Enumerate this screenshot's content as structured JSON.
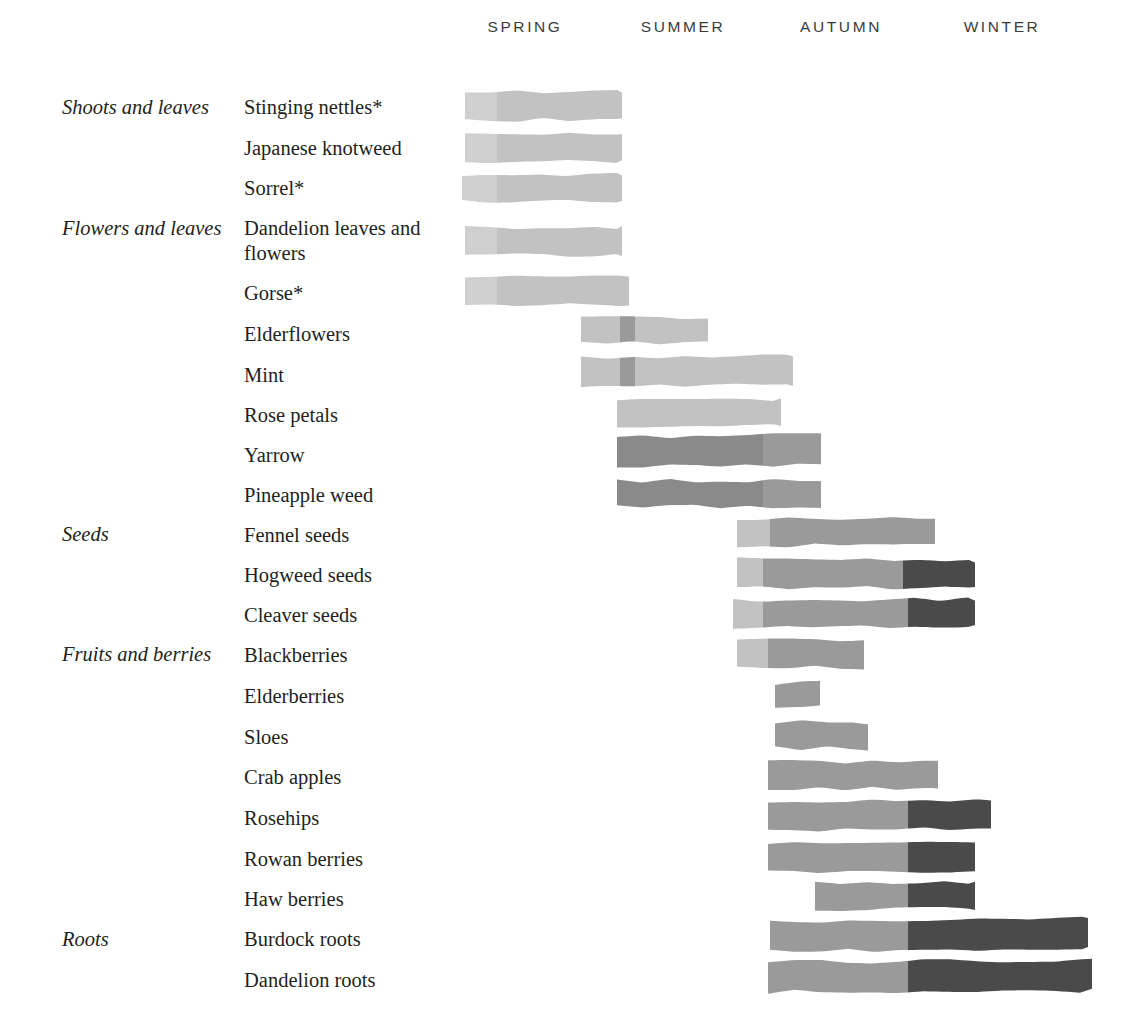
{
  "chart_data": {
    "type": "bar",
    "title": "",
    "subtitle": "",
    "xlabel": "",
    "ylabel": "",
    "grid": false,
    "legend_position": "none",
    "orientation": "horizontal",
    "axis": {
      "seasons": [
        "SPRING",
        "SUMMER",
        "AUTUMN",
        "WINTER"
      ],
      "season_centers_px": [
        525,
        683,
        841,
        1002
      ],
      "season_start_px": 465,
      "season_width_px": 158,
      "x_range_px": [
        465,
        1092
      ]
    },
    "shades": {
      "light": "#cfcfcf",
      "light2": "#c2c2c2",
      "medium": "#9a9a9a",
      "medium_dark": "#8a8a8a",
      "dark": "#4a4a4a"
    },
    "groups": [
      {
        "label": "Shoots and leaves",
        "top_px": 95,
        "row_span": 3
      },
      {
        "label": "Flowers and leaves",
        "top_px": 216,
        "row_span": 7
      },
      {
        "label": "Seeds",
        "top_px": 522,
        "row_span": 3
      },
      {
        "label": "Fruits and berries",
        "top_px": 642,
        "row_span": 7
      },
      {
        "label": "Roots",
        "top_px": 927,
        "row_span": 2
      }
    ],
    "categories": [
      "Stinging nettles*",
      "Japanese knotweed",
      "Sorrel*",
      "Dandelion leaves and flowers",
      "Gorse*",
      "Elderflowers",
      "Mint",
      "Rose petals",
      "Yarrow",
      "Pineapple weed",
      "Fennel seeds",
      "Hogweed seeds",
      "Cleaver seeds",
      "Blackberries",
      "Elderberries",
      "Sloes",
      "Crab apples",
      "Rosehips",
      "Rowan berries",
      "Haw berries",
      "Burdock roots",
      "Dandelion roots"
    ],
    "rows": [
      {
        "name": "Stinging nettles*",
        "label": "Stinging nettles*",
        "label_top": 95,
        "label_lines": 1,
        "bar_y": 92,
        "bar_h": 28,
        "start_px": 465,
        "end_px": 622,
        "seasons": [
          "spring"
        ],
        "segments": [
          {
            "from": 465,
            "to": 497,
            "shade": "light"
          },
          {
            "from": 497,
            "to": 622,
            "shade": "light2"
          }
        ]
      },
      {
        "name": "Japanese knotweed",
        "label": "Japanese knotweed",
        "label_top": 136,
        "label_lines": 1,
        "bar_y": 133,
        "bar_h": 28,
        "start_px": 465,
        "end_px": 622,
        "seasons": [
          "spring"
        ],
        "segments": [
          {
            "from": 465,
            "to": 497,
            "shade": "light"
          },
          {
            "from": 497,
            "to": 622,
            "shade": "light2"
          }
        ]
      },
      {
        "name": "Sorrel*",
        "label": "Sorrel*",
        "label_top": 176,
        "label_lines": 1,
        "bar_y": 175,
        "bar_h": 27,
        "start_px": 462,
        "end_px": 622,
        "seasons": [
          "spring"
        ],
        "segments": [
          {
            "from": 462,
            "to": 497,
            "shade": "light"
          },
          {
            "from": 497,
            "to": 622,
            "shade": "light2"
          }
        ]
      },
      {
        "name": "Dandelion leaves and flowers",
        "label": "Dandelion leaves and flowers",
        "label_top": 216,
        "label_lines": 2,
        "bar_y": 228,
        "bar_h": 27,
        "start_px": 465,
        "end_px": 622,
        "seasons": [
          "spring"
        ],
        "segments": [
          {
            "from": 465,
            "to": 497,
            "shade": "light"
          },
          {
            "from": 497,
            "to": 622,
            "shade": "light2"
          }
        ]
      },
      {
        "name": "Gorse*",
        "label": "Gorse*",
        "label_top": 281,
        "label_lines": 1,
        "bar_y": 278,
        "bar_h": 28,
        "start_px": 465,
        "end_px": 629,
        "seasons": [
          "spring"
        ],
        "segments": [
          {
            "from": 465,
            "to": 497,
            "shade": "light"
          },
          {
            "from": 497,
            "to": 629,
            "shade": "light2"
          }
        ]
      },
      {
        "name": "Elderflowers",
        "label": "Elderflowers",
        "label_top": 322,
        "label_lines": 1,
        "bar_y": 316,
        "bar_h": 26,
        "start_px": 581,
        "end_px": 708,
        "seasons": [
          "spring",
          "summer"
        ],
        "segments": [
          {
            "from": 581,
            "to": 620,
            "shade": "light2"
          },
          {
            "from": 620,
            "to": 635,
            "shade": "medium"
          },
          {
            "from": 635,
            "to": 708,
            "shade": "light2"
          }
        ]
      },
      {
        "name": "Mint",
        "label": "Mint",
        "label_top": 363,
        "label_lines": 1,
        "bar_y": 358,
        "bar_h": 28,
        "start_px": 581,
        "end_px": 793,
        "seasons": [
          "spring",
          "summer"
        ],
        "segments": [
          {
            "from": 581,
            "to": 620,
            "shade": "light2"
          },
          {
            "from": 620,
            "to": 635,
            "shade": "medium"
          },
          {
            "from": 635,
            "to": 793,
            "shade": "light2"
          }
        ]
      },
      {
        "name": "Rose petals",
        "label": "Rose petals",
        "label_top": 403,
        "label_lines": 1,
        "bar_y": 400,
        "bar_h": 26,
        "start_px": 617,
        "end_px": 781,
        "seasons": [
          "summer"
        ],
        "segments": [
          {
            "from": 617,
            "to": 781,
            "shade": "light2"
          }
        ]
      },
      {
        "name": "Yarrow",
        "label": "Yarrow",
        "label_top": 443,
        "label_lines": 1,
        "bar_y": 437,
        "bar_h": 30,
        "start_px": 617,
        "end_px": 821,
        "seasons": [
          "summer",
          "autumn"
        ],
        "segments": [
          {
            "from": 617,
            "to": 763,
            "shade": "medium_dark"
          },
          {
            "from": 763,
            "to": 821,
            "shade": "medium"
          }
        ]
      },
      {
        "name": "Pineapple weed",
        "label": "Pineapple weed",
        "label_top": 483,
        "label_lines": 1,
        "bar_y": 481,
        "bar_h": 26,
        "start_px": 617,
        "end_px": 821,
        "seasons": [
          "summer",
          "autumn"
        ],
        "segments": [
          {
            "from": 617,
            "to": 763,
            "shade": "medium_dark"
          },
          {
            "from": 763,
            "to": 821,
            "shade": "medium"
          }
        ]
      },
      {
        "name": "Fennel seeds",
        "label": "Fennel seeds",
        "label_top": 523,
        "label_lines": 1,
        "bar_y": 519,
        "bar_h": 27,
        "start_px": 737,
        "end_px": 935,
        "seasons": [
          "autumn"
        ],
        "segments": [
          {
            "from": 737,
            "to": 770,
            "shade": "light2"
          },
          {
            "from": 770,
            "to": 935,
            "shade": "medium"
          }
        ]
      },
      {
        "name": "Hogweed seeds",
        "label": "Hogweed seeds",
        "label_top": 563,
        "label_lines": 1,
        "bar_y": 559,
        "bar_h": 28,
        "start_px": 737,
        "end_px": 975,
        "seasons": [
          "autumn",
          "winter"
        ],
        "segments": [
          {
            "from": 737,
            "to": 763,
            "shade": "light2"
          },
          {
            "from": 763,
            "to": 903,
            "shade": "medium"
          },
          {
            "from": 903,
            "to": 975,
            "shade": "dark"
          }
        ]
      },
      {
        "name": "Cleaver seeds",
        "label": "Cleaver seeds",
        "label_top": 603,
        "label_lines": 1,
        "bar_y": 600,
        "bar_h": 28,
        "start_px": 733,
        "end_px": 975,
        "seasons": [
          "autumn",
          "winter"
        ],
        "segments": [
          {
            "from": 733,
            "to": 763,
            "shade": "light2"
          },
          {
            "from": 763,
            "to": 908,
            "shade": "medium"
          },
          {
            "from": 908,
            "to": 975,
            "shade": "dark"
          }
        ]
      },
      {
        "name": "Blackberries",
        "label": "Blackberries",
        "label_top": 643,
        "label_lines": 1,
        "bar_y": 640,
        "bar_h": 28,
        "start_px": 737,
        "end_px": 864,
        "seasons": [
          "autumn"
        ],
        "segments": [
          {
            "from": 737,
            "to": 768,
            "shade": "light2"
          },
          {
            "from": 768,
            "to": 864,
            "shade": "medium"
          }
        ]
      },
      {
        "name": "Elderberries",
        "label": "Elderberries",
        "label_top": 684,
        "label_lines": 1,
        "bar_y": 683,
        "bar_h": 24,
        "start_px": 775,
        "end_px": 820,
        "seasons": [
          "autumn"
        ],
        "segments": [
          {
            "from": 775,
            "to": 820,
            "shade": "medium"
          }
        ]
      },
      {
        "name": "Sloes",
        "label": "Sloes",
        "label_top": 725,
        "label_lines": 1,
        "bar_y": 722,
        "bar_h": 26,
        "start_px": 775,
        "end_px": 868,
        "seasons": [
          "autumn"
        ],
        "segments": [
          {
            "from": 775,
            "to": 868,
            "shade": "medium"
          }
        ]
      },
      {
        "name": "Crab apples",
        "label": "Crab apples",
        "label_top": 765,
        "label_lines": 1,
        "bar_y": 762,
        "bar_h": 27,
        "start_px": 768,
        "end_px": 938,
        "seasons": [
          "autumn"
        ],
        "segments": [
          {
            "from": 768,
            "to": 938,
            "shade": "medium"
          }
        ]
      },
      {
        "name": "Rosehips",
        "label": "Rosehips",
        "label_top": 806,
        "label_lines": 1,
        "bar_y": 802,
        "bar_h": 28,
        "start_px": 768,
        "end_px": 991,
        "seasons": [
          "autumn",
          "winter"
        ],
        "segments": [
          {
            "from": 768,
            "to": 908,
            "shade": "medium"
          },
          {
            "from": 908,
            "to": 991,
            "shade": "dark"
          }
        ]
      },
      {
        "name": "Rowan berries",
        "label": "Rowan berries",
        "label_top": 847,
        "label_lines": 1,
        "bar_y": 843,
        "bar_h": 28,
        "start_px": 768,
        "end_px": 975,
        "seasons": [
          "autumn",
          "winter"
        ],
        "segments": [
          {
            "from": 768,
            "to": 908,
            "shade": "medium"
          },
          {
            "from": 908,
            "to": 975,
            "shade": "dark"
          }
        ]
      },
      {
        "name": "Haw berries",
        "label": "Haw berries",
        "label_top": 887,
        "label_lines": 1,
        "bar_y": 883,
        "bar_h": 26,
        "start_px": 815,
        "end_px": 975,
        "seasons": [
          "autumn",
          "winter"
        ],
        "segments": [
          {
            "from": 815,
            "to": 908,
            "shade": "medium"
          },
          {
            "from": 908,
            "to": 975,
            "shade": "dark"
          }
        ]
      },
      {
        "name": "Burdock roots",
        "label": "Burdock roots",
        "label_top": 927,
        "label_lines": 1,
        "bar_y": 921,
        "bar_h": 30,
        "start_px": 770,
        "end_px": 1088,
        "seasons": [
          "autumn",
          "winter"
        ],
        "segments": [
          {
            "from": 770,
            "to": 908,
            "shade": "medium"
          },
          {
            "from": 908,
            "to": 1088,
            "shade": "dark"
          }
        ]
      },
      {
        "name": "Dandelion roots",
        "label": "Dandelion roots",
        "label_top": 968,
        "label_lines": 1,
        "bar_y": 962,
        "bar_h": 30,
        "start_px": 768,
        "end_px": 1092,
        "seasons": [
          "autumn",
          "winter"
        ],
        "segments": [
          {
            "from": 768,
            "to": 908,
            "shade": "medium"
          },
          {
            "from": 908,
            "to": 1092,
            "shade": "dark"
          }
        ]
      }
    ]
  }
}
